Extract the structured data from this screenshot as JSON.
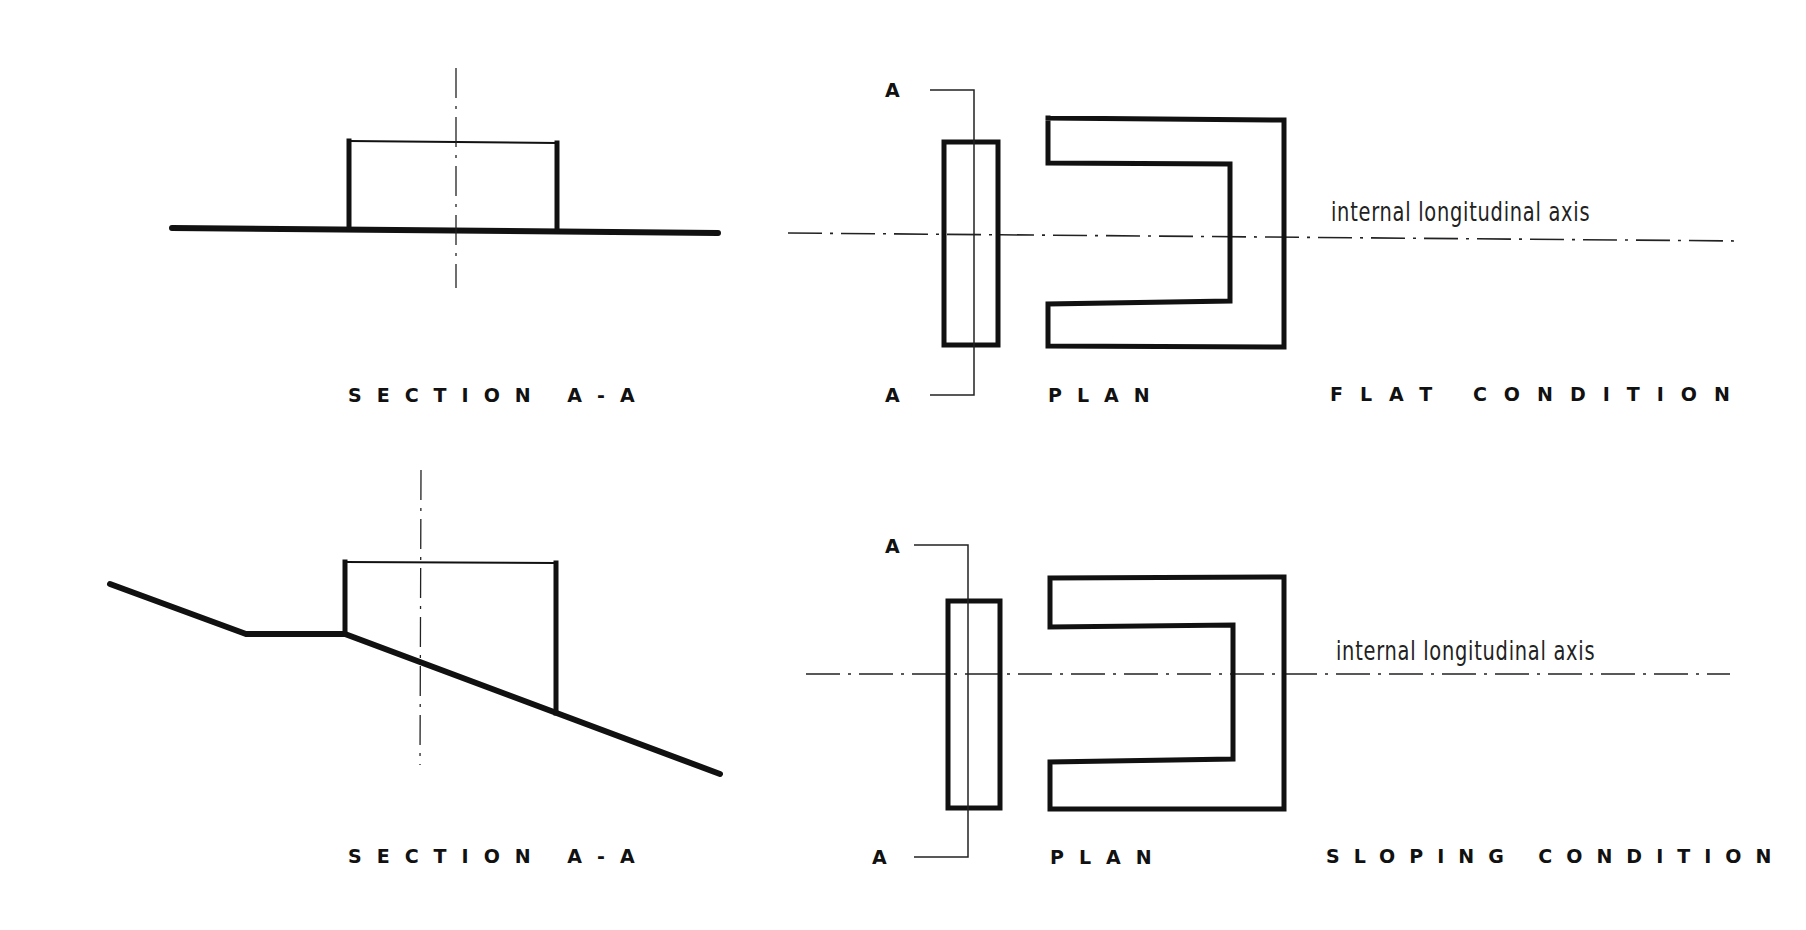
{
  "diagram": {
    "type": "architectural comparison drawing",
    "rows": [
      {
        "condition": "FLAT CONDITION",
        "section_label": "SECTION A-A",
        "plan_label": "PLAN",
        "axis_label": "internal longitudinal axis",
        "cut_marker_top": "A",
        "cut_marker_bottom": "A"
      },
      {
        "condition": "SLOPING CONDITION",
        "section_label": "SECTION A-A",
        "plan_label": "PLAN",
        "axis_label": "internal longitudinal axis",
        "cut_marker_top": "A",
        "cut_marker_bottom": "A"
      }
    ]
  },
  "colors": {
    "ink": "#111111",
    "paper": "#ffffff"
  }
}
